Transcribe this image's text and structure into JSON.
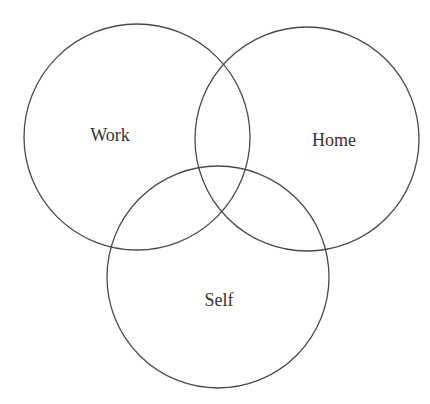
{
  "diagram": {
    "type": "venn",
    "stroke_color": "#4a4a4a",
    "text_color": "#333333",
    "background": "#ffffff",
    "sets": [
      {
        "id": "work",
        "label": "Work",
        "cx": 137,
        "cy": 137,
        "r": 113,
        "label_x": 110,
        "label_y": 141
      },
      {
        "id": "home",
        "label": "Home",
        "cx": 307,
        "cy": 139,
        "r": 112,
        "label_x": 334,
        "label_y": 146
      },
      {
        "id": "self",
        "label": "Self",
        "cx": 218,
        "cy": 277,
        "r": 111,
        "label_x": 219,
        "label_y": 306
      }
    ]
  }
}
